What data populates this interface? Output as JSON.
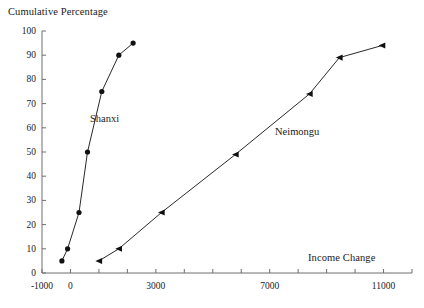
{
  "chart_data": {
    "type": "line",
    "title": "",
    "ylabel": "Cumulative Percentage",
    "xlabel": "Income Change",
    "xlim": [
      -1000,
      12000
    ],
    "ylim": [
      0,
      100
    ],
    "grid": false,
    "legend": "inline-annotations",
    "x_ticks": [
      -1000,
      0,
      1000,
      2000,
      3000,
      4000,
      5000,
      6000,
      7000,
      8000,
      9000,
      10000,
      11000,
      12000
    ],
    "x_tick_labels": [
      "-1000",
      "0",
      "",
      "",
      "3000",
      "",
      "",
      "",
      "7000",
      "",
      "",
      "",
      "11000",
      ""
    ],
    "y_ticks": [
      0,
      10,
      20,
      30,
      40,
      50,
      60,
      70,
      80,
      90,
      100
    ],
    "y_tick_labels": [
      "0",
      "10",
      "20",
      "30",
      "40",
      "50",
      "60",
      "70",
      "80",
      "90",
      "100"
    ],
    "series": [
      {
        "name": "Shanxi",
        "marker": "circle",
        "color": "#111111",
        "x": [
          -300,
          -100,
          300,
          600,
          1100,
          1700,
          2200
        ],
        "y": [
          5,
          10,
          25,
          50,
          75,
          90,
          95
        ]
      },
      {
        "name": "Neimongu",
        "marker": "triangle-left",
        "color": "#111111",
        "x": [
          1000,
          1700,
          3200,
          5800,
          8400,
          9450,
          10950
        ],
        "y": [
          5,
          10,
          25,
          49,
          74,
          89,
          94
        ]
      }
    ]
  },
  "axis": {
    "y_title": "Cumulative Percentage",
    "x_title": "Income Change"
  },
  "annotations": {
    "shanxi": "Shanxi",
    "neimongu": "Neimongu"
  },
  "colors": {
    "axis": "#6e6e6e",
    "data": "#111111",
    "background": "#ffffff"
  }
}
